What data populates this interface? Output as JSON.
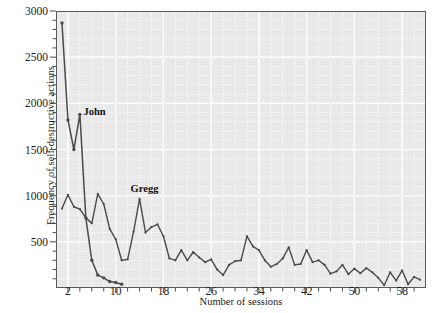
{
  "chart_data": {
    "type": "line",
    "title": "",
    "xlabel": "Number of sessions",
    "ylabel": "Frequency of self-destructive actions",
    "xlim": [
      0,
      62
    ],
    "ylim": [
      0,
      3000
    ],
    "grid": true,
    "legend_position": "inline-annotation",
    "background_color": "#e9e9e9",
    "gridline_color": "#ffffff",
    "line_color": "#4a4a4a",
    "xticks": [
      2,
      10,
      18,
      26,
      34,
      42,
      50,
      58
    ],
    "xtick_labels": [
      "2",
      "10",
      "18",
      "26",
      "34",
      "42",
      "50",
      "58"
    ],
    "xminor_step": 2,
    "yticks": [
      500,
      1000,
      1500,
      2000,
      2500,
      3000
    ],
    "ytick_labels": [
      "500",
      "1000",
      "1500",
      "2000",
      "2500",
      "3000"
    ],
    "yminor_step": 100,
    "series": [
      {
        "name": "John",
        "label_x": 4.6,
        "label_y": 1890,
        "markers": true,
        "x": [
          1,
          2,
          3,
          4,
          5,
          6,
          7,
          8,
          9,
          10,
          11
        ],
        "values": [
          2870,
          1820,
          1500,
          1880,
          760,
          300,
          140,
          110,
          70,
          60,
          40
        ]
      },
      {
        "name": "Gregg",
        "label_x": 12.5,
        "label_y": 1060,
        "markers": true,
        "x": [
          1,
          2,
          3,
          4,
          5,
          6,
          7,
          8,
          9,
          10,
          11,
          12,
          13,
          14,
          15,
          16,
          17,
          18,
          19,
          20,
          21,
          22,
          23,
          24,
          25,
          26,
          27,
          28,
          29,
          30,
          31,
          32,
          33,
          34,
          35,
          36,
          37,
          38,
          39,
          40,
          41,
          42,
          43,
          44,
          45,
          46,
          47,
          48,
          49,
          50,
          51,
          52,
          53,
          54,
          55,
          56,
          57,
          58,
          59,
          60,
          61
        ],
        "values": [
          860,
          1010,
          880,
          855,
          760,
          700,
          1020,
          910,
          640,
          530,
          300,
          310,
          610,
          965,
          600,
          660,
          690,
          560,
          320,
          300,
          410,
          300,
          390,
          330,
          280,
          310,
          200,
          140,
          250,
          290,
          300,
          560,
          450,
          410,
          300,
          230,
          260,
          320,
          440,
          250,
          260,
          410,
          280,
          300,
          250,
          155,
          180,
          250,
          150,
          210,
          160,
          215,
          170,
          110,
          30,
          170,
          80,
          190,
          40,
          120,
          90
        ]
      }
    ]
  },
  "axis": {
    "x_title": "Number of sessions",
    "y_title": "Frequency of self-destructive actions"
  },
  "annotations": {
    "john": "John",
    "gregg": "Gregg"
  }
}
